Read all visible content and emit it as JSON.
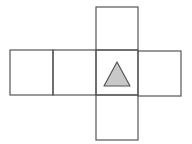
{
  "diagram": {
    "type": "cube-net",
    "stroke_color": "#555555",
    "stroke_width": 1.2,
    "faces": [
      {
        "id": "face-1",
        "x": 10,
        "y": 50,
        "w": 43,
        "h": 45,
        "symbol": ""
      },
      {
        "id": "face-2",
        "x": 53,
        "y": 50,
        "w": 43,
        "h": 45,
        "symbol": ""
      },
      {
        "id": "face-3",
        "x": 96,
        "y": 50,
        "w": 42,
        "h": 45,
        "symbol": "triangle"
      },
      {
        "id": "face-4",
        "x": 138,
        "y": 51,
        "w": 43,
        "h": 45,
        "symbol": ""
      },
      {
        "id": "face-top",
        "x": 96,
        "y": 7,
        "w": 42,
        "h": 43,
        "symbol": ""
      },
      {
        "id": "face-bottom",
        "x": 96,
        "y": 95,
        "w": 42,
        "h": 45,
        "symbol": ""
      }
    ],
    "triangle": {
      "points": "117,62 104,86 130,86",
      "fill": "#c8c8c8",
      "stroke": "#555555"
    }
  }
}
